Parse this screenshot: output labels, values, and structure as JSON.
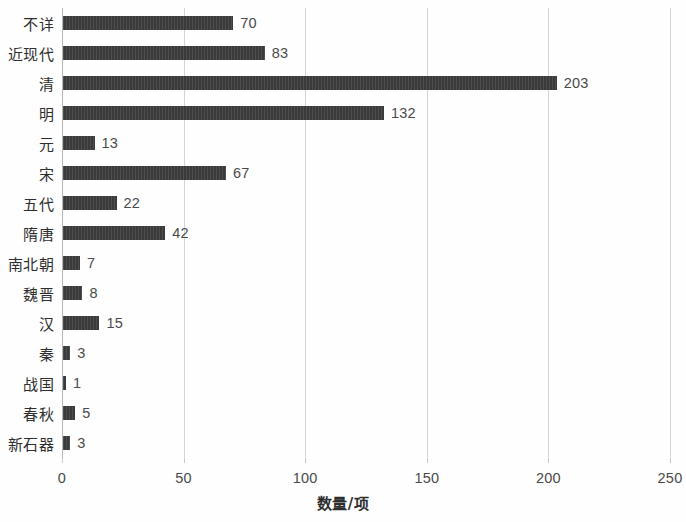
{
  "chart_data": {
    "type": "bar",
    "orientation": "horizontal",
    "title": "",
    "xlabel": "数量/项",
    "ylabel": "",
    "xlim": [
      0,
      250
    ],
    "xticks": [
      0,
      50,
      100,
      150,
      200,
      250
    ],
    "grid": true,
    "legend": null,
    "bar_color": "#3a3a3a",
    "categories": [
      "不详",
      "近现代",
      "清",
      "明",
      "元",
      "宋",
      "五代",
      "隋唐",
      "南北朝",
      "魏晋",
      "汉",
      "秦",
      "战国",
      "春秋",
      "新石器"
    ],
    "values": [
      70,
      83,
      203,
      132,
      13,
      67,
      22,
      42,
      7,
      8,
      15,
      3,
      1,
      5,
      3
    ],
    "data_labels": [
      "70",
      "83",
      "203",
      "132",
      "13",
      "67",
      "22",
      "42",
      "7",
      "8",
      "15",
      "3",
      "1",
      "5",
      "3"
    ]
  }
}
